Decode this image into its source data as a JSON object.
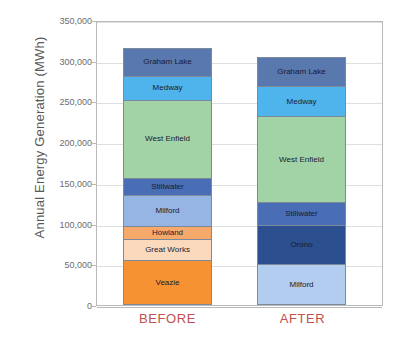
{
  "chart_data": {
    "type": "bar",
    "subtype": "stacked-bar",
    "title": "",
    "xlabel": "",
    "ylabel": "Annual Energy Generation (MWh)",
    "ylim": [
      0,
      350000
    ],
    "ytick_labels": [
      "350,000",
      "300,000",
      "250,000",
      "200,000",
      "150,000",
      "100,000",
      "50,000",
      "0"
    ],
    "ytick_values": [
      350000,
      300000,
      250000,
      200000,
      150000,
      100000,
      50000,
      0
    ],
    "grid": true,
    "legend": "none (in-bar labels)",
    "categories": [
      "BEFORE",
      "AFTER"
    ],
    "bars": [
      {
        "category": "BEFORE",
        "total": 315700,
        "segments": [
          {
            "name": "Graham Lake",
            "value": 34400,
            "color": "#5878ae"
          },
          {
            "name": "Medway",
            "value": 29500,
            "color": "#4fb3ec"
          },
          {
            "name": "West Enfield",
            "value": 97000,
            "color": "#a2d3a7"
          },
          {
            "name": "Stillwater",
            "value": 20900,
            "color": "#4a6eb5"
          },
          {
            "name": "Milford",
            "value": 38100,
            "color": "#97b5e4"
          },
          {
            "name": "Howland",
            "value": 17200,
            "color": "#f6a96a"
          },
          {
            "name": "Great Works",
            "value": 25800,
            "color": "#fbd9bc"
          },
          {
            "name": "Veazie",
            "value": 52800,
            "color": "#f79233"
          }
        ]
      },
      {
        "category": "AFTER",
        "total": 304700,
        "segments": [
          {
            "name": "Graham Lake",
            "value": 35600,
            "color": "#5878ae"
          },
          {
            "name": "Medway",
            "value": 38100,
            "color": "#4fb3ec"
          },
          {
            "name": "West Enfield",
            "value": 105700,
            "color": "#a2d3a7"
          },
          {
            "name": "Stillwater",
            "value": 28300,
            "color": "#4a6eb5"
          },
          {
            "name": "Orono",
            "value": 49100,
            "color": "#2c4f8f"
          },
          {
            "name": "Milford",
            "value": 47900,
            "color": "#b3cdf0"
          }
        ]
      }
    ],
    "colors": {
      "category_label": "#c0504d",
      "axis_text": "#6d6d6d",
      "axis_title": "#595959",
      "gridline": "#dfdfdf",
      "frame": "#b9b9b9",
      "segment_border": "#7a8a9a"
    }
  },
  "axis": {
    "y_title": "Annual Energy Generation (MWh)"
  },
  "labels": {
    "before": "BEFORE",
    "after": "AFTER"
  }
}
